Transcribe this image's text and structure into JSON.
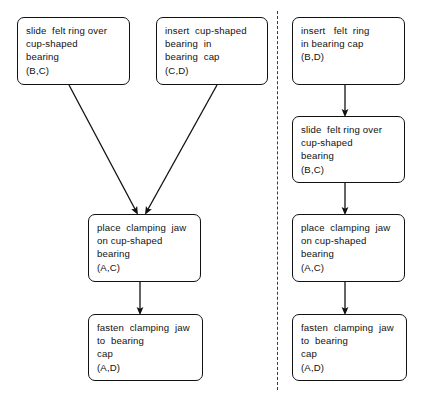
{
  "diagram": {
    "type": "flowchart",
    "panels": [
      {
        "id": "left-panel",
        "name": "left-variant",
        "nodes": [
          {
            "id": "L1",
            "name": "slide-felt-ring-over-cup-shaped-bearing",
            "lines": [
              "slide  felt ring over",
              "cup-shaped",
              "bearing",
              "(B,C)"
            ],
            "x": 17,
            "y": 17,
            "w": 113,
            "h": 68
          },
          {
            "id": "L2",
            "name": "insert-cup-shaped-bearing-in-bearing-cap",
            "lines": [
              "insert  cup-shaped",
              "bearing  in",
              "bearing  cap",
              "(C,D)"
            ],
            "x": 156,
            "y": 17,
            "w": 112,
            "h": 68
          },
          {
            "id": "L3",
            "name": "place-clamping-jaw-on-cup-shaped-bearing",
            "lines": [
              "place  clamping  jaw",
              "on cup-shaped",
              "bearing",
              "(A,C)"
            ],
            "x": 88,
            "y": 214,
            "w": 113,
            "h": 68
          },
          {
            "id": "L4",
            "name": "fasten-clamping-jaw-to-bearing-cap",
            "lines": [
              "fasten  clamping  jaw",
              "to  bearing",
              "cap",
              "(A,D)"
            ],
            "x": 88,
            "y": 314,
            "w": 115,
            "h": 67
          }
        ],
        "edges": [
          {
            "name": "edge-L1-to-L3",
            "from": "L1",
            "to": "L3",
            "x1": 69,
            "y1": 85,
            "x2": 136,
            "y2": 211
          },
          {
            "name": "edge-L2-to-L3",
            "from": "L2",
            "to": "L3",
            "x1": 217,
            "y1": 85,
            "x2": 147,
            "y2": 211
          },
          {
            "name": "edge-L3-to-L4",
            "from": "L3",
            "to": "L4",
            "x1": 140,
            "y1": 282,
            "x2": 140,
            "y2": 311
          }
        ]
      },
      {
        "id": "right-panel",
        "name": "right-variant",
        "nodes": [
          {
            "id": "R1",
            "name": "insert-felt-ring-in-bearing-cap",
            "lines": [
              "insert   felt  ring",
              "in bearing cap",
              "(B,D)"
            ],
            "x": 292,
            "y": 17,
            "w": 113,
            "h": 68
          },
          {
            "id": "R2",
            "name": "slide-felt-ring-over-cup-shaped-bearing",
            "lines": [
              "slide  felt ring over",
              "cup-shaped",
              "bearing",
              "(B,C)"
            ],
            "x": 292,
            "y": 116,
            "w": 113,
            "h": 67
          },
          {
            "id": "R3",
            "name": "place-clamping-jaw-on-cup-shaped-bearing",
            "lines": [
              "place  clamping  jaw",
              "on cup-shaped",
              "bearing",
              "(A,C)"
            ],
            "x": 292,
            "y": 214,
            "w": 113,
            "h": 68
          },
          {
            "id": "R4",
            "name": "fasten-clamping-jaw-to-bearing-cap",
            "lines": [
              "fasten  clamping  jaw",
              "to  bearing",
              "cap",
              "(A,D)"
            ],
            "x": 292,
            "y": 314,
            "w": 115,
            "h": 67
          }
        ],
        "edges": [
          {
            "name": "edge-R1-to-R2",
            "from": "R1",
            "to": "R2",
            "x1": 345,
            "y1": 85,
            "x2": 345,
            "y2": 113
          },
          {
            "name": "edge-R2-to-R3",
            "from": "R2",
            "to": "R3",
            "x1": 345,
            "y1": 183,
            "x2": 345,
            "y2": 211
          },
          {
            "name": "edge-R3-to-R4",
            "from": "R3",
            "to": "R4",
            "x1": 345,
            "y1": 282,
            "x2": 345,
            "y2": 311
          }
        ]
      }
    ],
    "divider": {
      "name": "panel-divider",
      "style": "dashed-vertical",
      "x": 277,
      "y1": 11,
      "y2": 390
    },
    "colors": {
      "stroke": "#111111",
      "background": "#ffffff",
      "divider": "#3a3a3a"
    }
  }
}
